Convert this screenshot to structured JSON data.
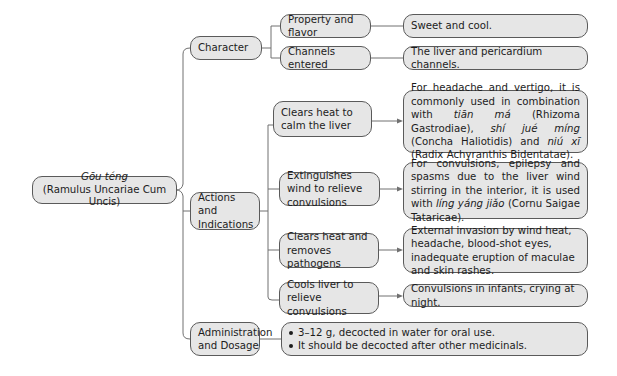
{
  "root": {
    "title_italic": "Gōu téng",
    "subtitle": "(Ramulus Uncariae Cum Uncis)"
  },
  "branches": [
    {
      "label": "Character",
      "items": [
        {
          "label": "Property and flavor",
          "detail": "Sweet and cool."
        },
        {
          "label": "Channels entered",
          "detail": "The liver and pericardium channels."
        }
      ]
    },
    {
      "label": "Actions and Indications",
      "items": [
        {
          "label": "Clears heat to calm the liver",
          "detail_parts": [
            {
              "t": "For headache and vertigo, it is commonly used in combination with "
            },
            {
              "t": "tiān má",
              "i": true
            },
            {
              "t": " (Rhizoma Gastrodiae), "
            },
            {
              "t": "shí jué míng",
              "i": true
            },
            {
              "t": " (Concha Haliotidis) and "
            },
            {
              "t": "niú xī",
              "i": true
            },
            {
              "t": " (Radix Achyranthis Bidentatae)."
            }
          ]
        },
        {
          "label": "Extinguishes wind to relieve convulsions",
          "detail_parts": [
            {
              "t": "For convulsions, epilepsy and spasms due to the liver wind stirring in the interior, it is used with "
            },
            {
              "t": "líng yáng jiǎo",
              "i": true
            },
            {
              "t": " (Cornu Saigae Tataricae)."
            }
          ]
        },
        {
          "label": "Clears heat and removes pathogens",
          "detail": "External invasion by wind heat, headache, blood-shot eyes, inadequate eruption of maculae and skin rashes."
        },
        {
          "label": "Cools liver to relieve convulsions",
          "detail": "Convulsions in infants, crying at night."
        }
      ]
    },
    {
      "label": "Administration and Dosage",
      "bullets": [
        "3–12 g, decocted in water for oral use.",
        "It should be decocted after other medicinals."
      ]
    }
  ],
  "colors": {
    "box_fill": "#e6e6e6",
    "box_border": "#5a5a5a",
    "connector": "#707070"
  }
}
